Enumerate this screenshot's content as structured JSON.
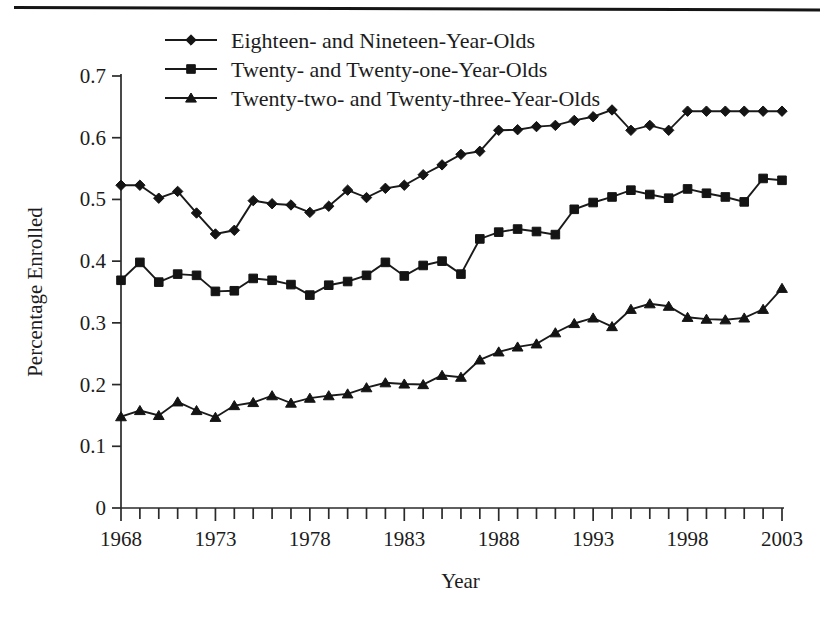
{
  "figure": {
    "background_color": "#ffffff",
    "ink_color": "#1a1a1a",
    "has_top_rule": true
  },
  "axes": {
    "x_title": "Year",
    "y_title": "Percentage Enrolled",
    "x_tick_labels": [
      "1968",
      "1973",
      "1978",
      "1983",
      "1988",
      "1993",
      "1998",
      "2003"
    ],
    "y_tick_labels": [
      "0",
      "0.1",
      "0.2",
      "0.3",
      "0.4",
      "0.5",
      "0.6",
      "0.7"
    ]
  },
  "legend": {
    "entries": [
      {
        "label": "Eighteen- and Nineteen-Year-Olds",
        "marker": "diamond-marker"
      },
      {
        "label": "Twenty- and Twenty-one-Year-Olds",
        "marker": "square-marker"
      },
      {
        "label": "Twenty-two- and Twenty-three-Year-Olds",
        "marker": "triangle-marker"
      }
    ]
  },
  "chart_data": {
    "type": "line",
    "title": "",
    "xlabel": "Year",
    "ylabel": "Percentage Enrolled",
    "xlim": [
      1968,
      2003
    ],
    "ylim": [
      0,
      0.7
    ],
    "xticks": [
      1968,
      1973,
      1978,
      1983,
      1988,
      1993,
      1998,
      2003
    ],
    "xtick_minor_step": 1,
    "yticks": [
      0,
      0.1,
      0.2,
      0.3,
      0.4,
      0.5,
      0.6,
      0.7
    ],
    "grid": false,
    "legend_position": "top-center",
    "x": [
      1968,
      1969,
      1970,
      1971,
      1972,
      1973,
      1974,
      1975,
      1976,
      1977,
      1978,
      1979,
      1980,
      1981,
      1982,
      1983,
      1984,
      1985,
      1986,
      1987,
      1988,
      1989,
      1990,
      1991,
      1992,
      1993,
      1994,
      1995,
      1996,
      1997,
      1998,
      1999,
      2000,
      2001,
      2002,
      2003
    ],
    "series": [
      {
        "name": "Eighteen- and Nineteen-Year-Olds",
        "marker": "diamond",
        "values": [
          0.523,
          0.523,
          0.502,
          0.513,
          0.478,
          0.444,
          0.45,
          0.498,
          0.493,
          0.491,
          0.479,
          0.489,
          0.515,
          0.503,
          0.518,
          0.523,
          0.54,
          0.556,
          0.573,
          0.578,
          0.612,
          0.613,
          0.618,
          0.62,
          0.628,
          0.634,
          0.645,
          0.612,
          0.62,
          0.612,
          0.643,
          0.643,
          0.643,
          0.643,
          0.643,
          0.643
        ]
      },
      {
        "name": "Twenty- and Twenty-one-Year-Olds",
        "marker": "square",
        "values": [
          0.369,
          0.398,
          0.366,
          0.379,
          0.377,
          0.351,
          0.352,
          0.372,
          0.369,
          0.362,
          0.345,
          0.361,
          0.367,
          0.377,
          0.398,
          0.376,
          0.393,
          0.4,
          0.379,
          0.436,
          0.447,
          0.452,
          0.448,
          0.443,
          0.484,
          0.495,
          0.504,
          0.515,
          0.508,
          0.502,
          0.517,
          0.51,
          0.504,
          0.496,
          0.534,
          0.531
        ]
      },
      {
        "name": "Twenty-two- and Twenty-three-Year-Olds",
        "marker": "triangle",
        "values": [
          0.148,
          0.158,
          0.15,
          0.172,
          0.158,
          0.147,
          0.166,
          0.171,
          0.182,
          0.17,
          0.178,
          0.182,
          0.185,
          0.195,
          0.203,
          0.201,
          0.2,
          0.215,
          0.212,
          0.24,
          0.253,
          0.261,
          0.266,
          0.284,
          0.299,
          0.308,
          0.294,
          0.322,
          0.331,
          0.327,
          0.309,
          0.306,
          0.305,
          0.308,
          0.322,
          0.356
        ]
      }
    ]
  }
}
